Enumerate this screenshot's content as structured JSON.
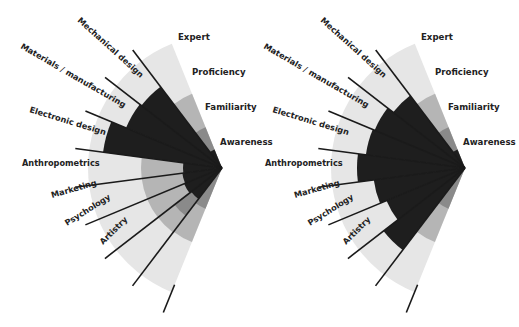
{
  "colors": {
    "light": "#e6e6e6",
    "mid": "#b5b5b5",
    "dark": "#8a8a8a",
    "black": "#1e1e1e",
    "line": "#1a1a1a",
    "text": "#222222"
  },
  "geometry": {
    "outer_radius": 134,
    "scale_radii": {
      "proficiency": 80,
      "familiarity": 44,
      "awareness": 20
    },
    "start_angle_deg": 112,
    "wedge_span_deg": 15.1,
    "line_length": 148
  },
  "scale_labels": [
    {
      "label": "Expert",
      "dx": -44,
      "dy": -128
    },
    {
      "label": "Proficiency",
      "dx": -30,
      "dy": -93
    },
    {
      "label": "Familiarity",
      "dx": -17,
      "dy": -58
    },
    {
      "label": "Awareness",
      "dx": -2,
      "dy": -23
    }
  ],
  "chart_data": [
    {
      "type": "radial-bar",
      "title": "",
      "center": [
        222,
        168
      ],
      "levels": [
        "Awareness",
        "Familiarity",
        "Proficiency",
        "Expert"
      ],
      "categories": [
        "Mechanical design",
        "Materials / manufacturing",
        "Electronic design",
        "Anthropometrics",
        "Marketing",
        "Psychology",
        "Artistry",
        ""
      ],
      "wedges": [
        {
          "mid": 0,
          "dark": 0,
          "black": 102
        },
        {
          "mid": 0,
          "dark": 0,
          "black": 104
        },
        {
          "mid": 0,
          "dark": 0,
          "black": 120
        },
        {
          "mid": 81,
          "dark": 0,
          "black": 39
        },
        {
          "mid": 81,
          "dark": 0,
          "black": 40
        },
        {
          "mid": 81,
          "dark": 0,
          "black": 41
        },
        {
          "mid": 81,
          "dark": 60,
          "black": 39
        },
        {
          "mid": 80,
          "dark": 44,
          "black": 0
        }
      ]
    },
    {
      "type": "radial-bar",
      "title": "",
      "center": [
        465,
        168
      ],
      "levels": [
        "Awareness",
        "Familiarity",
        "Proficiency",
        "Expert"
      ],
      "categories": [
        "Mechanical design",
        "Materials / manufacturing",
        "Electronic design",
        "Anthropometrics",
        "Marketing",
        "Psychology",
        "Artistry",
        ""
      ],
      "wedges": [
        {
          "mid": 0,
          "dark": 0,
          "black": 91
        },
        {
          "mid": 0,
          "dark": 0,
          "black": 98
        },
        {
          "mid": 0,
          "dark": 0,
          "black": 100
        },
        {
          "mid": 0,
          "dark": 0,
          "black": 108
        },
        {
          "mid": 0,
          "dark": 0,
          "black": 92
        },
        {
          "mid": 0,
          "dark": 0,
          "black": 85
        },
        {
          "mid": 0,
          "dark": 0,
          "black": 103
        },
        {
          "mid": 80,
          "dark": 44,
          "black": 0
        }
      ]
    }
  ],
  "category_labels": [
    {
      "label": "Mechanical design",
      "dx": -145,
      "dy": -147,
      "rot": 42
    },
    {
      "label": "Materials / manufacturing",
      "dx": -202,
      "dy": -120,
      "rot": 30
    },
    {
      "label": "Electronic design",
      "dx": -193,
      "dy": -56,
      "rot": 17
    },
    {
      "label": "Anthropometrics",
      "dx": -200,
      "dy": -2,
      "rot": 0
    },
    {
      "label": "Marketing",
      "dx": -170,
      "dy": 30,
      "rot": -16
    },
    {
      "label": "Psychology",
      "dx": -155,
      "dy": 58,
      "rot": -32
    },
    {
      "label": "Artistry",
      "dx": -119,
      "dy": 77,
      "rot": -45
    }
  ]
}
